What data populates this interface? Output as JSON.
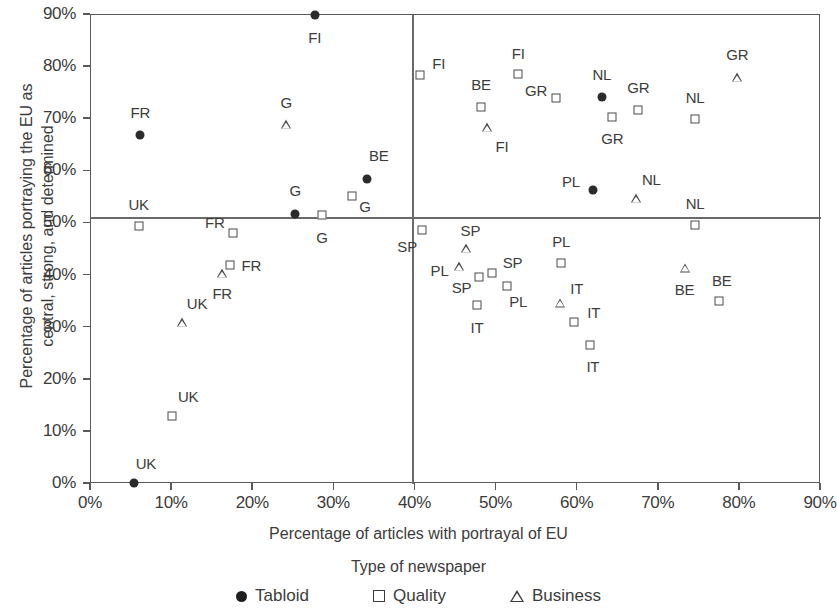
{
  "chart_data": {
    "type": "scatter",
    "title": "",
    "xlabel": "Percentage of articles with portrayal of EU",
    "ylabel": "Percentage of articles portraying the EU as central, strong, and determined",
    "legend_title": "Type of newspaper",
    "xlim": [
      0,
      90
    ],
    "ylim": [
      0,
      90
    ],
    "xticks": [
      "0%",
      "10%",
      "20%",
      "30%",
      "40%",
      "50%",
      "60%",
      "70%",
      "80%",
      "90%"
    ],
    "yticks": [
      "0%",
      "10%",
      "20%",
      "30%",
      "40%",
      "50%",
      "60%",
      "70%",
      "80%",
      "90%"
    ],
    "grid": false,
    "legend_position": "bottom",
    "reference_lines": {
      "vertical_x": 39.7,
      "horizontal_y": 51.0
    },
    "legend": [
      {
        "key": "tabloid",
        "label": "Tabloid",
        "marker": "filled-circle"
      },
      {
        "key": "quality",
        "label": "Quality",
        "marker": "open-square"
      },
      {
        "key": "business",
        "label": "Business",
        "marker": "open-triangle"
      }
    ],
    "points": [
      {
        "label": "FI",
        "type": "tabloid",
        "x": 27.7,
        "y": 89.8,
        "lx": 27.7,
        "ly": 85.5
      },
      {
        "label": "FR",
        "type": "tabloid",
        "x": 6.2,
        "y": 66.7,
        "lx": 6.2,
        "ly": 71.2
      },
      {
        "label": "G",
        "type": "business",
        "x": 24.2,
        "y": 68.9,
        "lx": 24.2,
        "ly": 73.2
      },
      {
        "label": "BE",
        "type": "tabloid",
        "x": 34.2,
        "y": 58.4,
        "lx": 35.6,
        "ly": 63.0
      },
      {
        "label": "G",
        "type": "quality",
        "x": 32.3,
        "y": 55.1,
        "lx": 33.9,
        "ly": 53.2
      },
      {
        "label": "G",
        "type": "tabloid",
        "x": 25.3,
        "y": 51.7,
        "lx": 25.3,
        "ly": 56.2
      },
      {
        "label": "G",
        "type": "quality",
        "x": 28.6,
        "y": 51.5,
        "lx": 28.6,
        "ly": 47.3
      },
      {
        "label": "UK",
        "type": "quality",
        "x": 6.0,
        "y": 49.3,
        "lx": 6.0,
        "ly": 53.5
      },
      {
        "label": "FR",
        "type": "quality",
        "x": 17.6,
        "y": 47.9,
        "lx": 15.4,
        "ly": 50.1
      },
      {
        "label": "FR",
        "type": "quality",
        "x": 17.3,
        "y": 41.8,
        "lx": 19.9,
        "ly": 41.9
      },
      {
        "label": "FR",
        "type": "business",
        "x": 16.3,
        "y": 40.3,
        "lx": 16.3,
        "ly": 36.5
      },
      {
        "label": "UK",
        "type": "business",
        "x": 11.3,
        "y": 30.8,
        "lx": 13.2,
        "ly": 34.6
      },
      {
        "label": "UK",
        "type": "quality",
        "x": 10.1,
        "y": 12.9,
        "lx": 12.1,
        "ly": 16.6
      },
      {
        "label": "UK",
        "type": "tabloid",
        "x": 5.4,
        "y": 0.0,
        "lx": 6.9,
        "ly": 3.8
      },
      {
        "label": "FI",
        "type": "quality",
        "x": 40.7,
        "y": 78.3,
        "lx": 43.0,
        "ly": 80.6
      },
      {
        "label": "FI",
        "type": "quality",
        "x": 52.8,
        "y": 78.4,
        "lx": 52.8,
        "ly": 82.6
      },
      {
        "label": "GR",
        "type": "business",
        "x": 79.8,
        "y": 77.9,
        "lx": 79.8,
        "ly": 82.3
      },
      {
        "label": "BE",
        "type": "quality",
        "x": 48.2,
        "y": 72.2,
        "lx": 48.2,
        "ly": 76.5
      },
      {
        "label": "NL",
        "type": "tabloid",
        "x": 63.1,
        "y": 74.1,
        "lx": 63.1,
        "ly": 78.4
      },
      {
        "label": "GR",
        "type": "quality",
        "x": 57.4,
        "y": 73.9,
        "lx": 55.0,
        "ly": 75.5
      },
      {
        "label": "GR",
        "type": "quality",
        "x": 67.6,
        "y": 71.6,
        "lx": 67.6,
        "ly": 75.9
      },
      {
        "label": "NL",
        "type": "quality",
        "x": 74.6,
        "y": 69.8,
        "lx": 74.6,
        "ly": 74.0
      },
      {
        "label": "GR",
        "type": "quality",
        "x": 64.4,
        "y": 70.3,
        "lx": 64.4,
        "ly": 66.2
      },
      {
        "label": "FI",
        "type": "business",
        "x": 49.0,
        "y": 68.3,
        "lx": 50.8,
        "ly": 64.6
      },
      {
        "label": "PL",
        "type": "tabloid",
        "x": 62.0,
        "y": 56.3,
        "lx": 59.3,
        "ly": 57.9
      },
      {
        "label": "NL",
        "type": "business",
        "x": 67.3,
        "y": 54.6,
        "lx": 69.2,
        "ly": 58.4
      },
      {
        "label": "NL",
        "type": "quality",
        "x": 74.6,
        "y": 49.6,
        "lx": 74.6,
        "ly": 53.8
      },
      {
        "label": "SP",
        "type": "quality",
        "x": 40.9,
        "y": 48.6,
        "lx": 39.1,
        "ly": 45.5
      },
      {
        "label": "SP",
        "type": "business",
        "x": 46.4,
        "y": 45.1,
        "lx": 46.9,
        "ly": 48.6
      },
      {
        "label": "PL",
        "type": "business",
        "x": 45.5,
        "y": 41.6,
        "lx": 43.1,
        "ly": 40.9
      },
      {
        "label": "SP",
        "type": "quality",
        "x": 48.0,
        "y": 39.6,
        "lx": 45.8,
        "ly": 37.6
      },
      {
        "label": "SP",
        "type": "quality",
        "x": 49.6,
        "y": 40.3,
        "lx": 52.1,
        "ly": 42.5
      },
      {
        "label": "PL",
        "type": "quality",
        "x": 51.4,
        "y": 37.8,
        "lx": 52.8,
        "ly": 34.9
      },
      {
        "label": "IT",
        "type": "quality",
        "x": 47.7,
        "y": 34.1,
        "lx": 47.7,
        "ly": 29.9
      },
      {
        "label": "PL",
        "type": "quality",
        "x": 58.1,
        "y": 42.3,
        "lx": 58.1,
        "ly": 46.4
      },
      {
        "label": "IT",
        "type": "business",
        "x": 57.9,
        "y": 34.6,
        "lx": 60.0,
        "ly": 37.4
      },
      {
        "label": "IT",
        "type": "quality",
        "x": 59.7,
        "y": 30.9,
        "lx": 62.1,
        "ly": 32.8
      },
      {
        "label": "IT",
        "type": "quality",
        "x": 61.6,
        "y": 26.5,
        "lx": 62.0,
        "ly": 22.5
      },
      {
        "label": "BE",
        "type": "business",
        "x": 73.3,
        "y": 41.3,
        "lx": 73.3,
        "ly": 37.3
      },
      {
        "label": "BE",
        "type": "quality",
        "x": 77.6,
        "y": 34.9,
        "lx": 77.9,
        "ly": 39.0
      }
    ]
  }
}
